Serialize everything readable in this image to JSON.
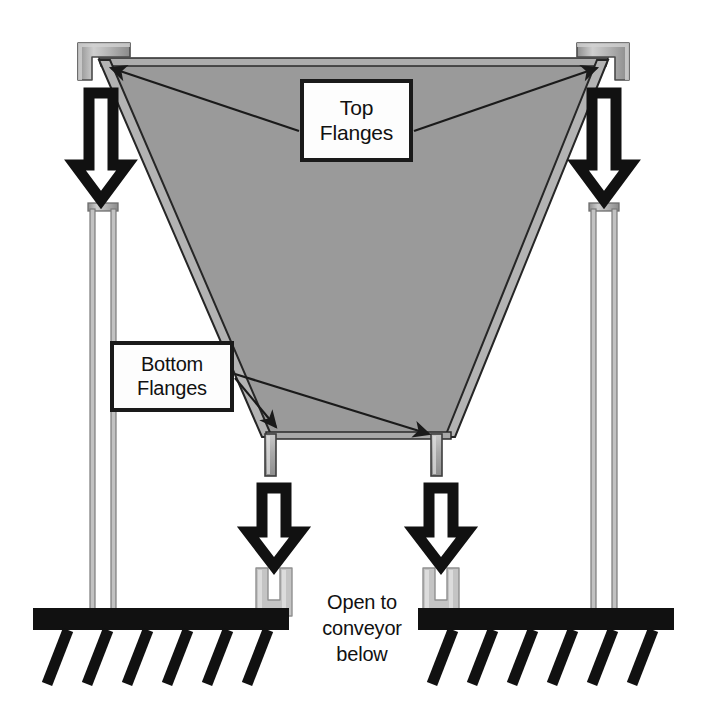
{
  "diagram": {
    "background_color": "#ffffff",
    "hopper_fill_color": "#9a9a9a",
    "outline_color": "#1a1a1a",
    "metal_color": "#b5b5b5",
    "conveyor_color": "#111111"
  },
  "labels": {
    "top_flanges": {
      "line1": "Top",
      "line2": "Flanges"
    },
    "bottom_flanges": {
      "line1": "Bottom",
      "line2": "Flanges"
    }
  },
  "caption": {
    "line1": "Open to",
    "line2": "conveyor",
    "line3": "below"
  },
  "parts": {
    "hopper": "hopper-body",
    "top_flange_left": "top-flange-left",
    "top_flange_right": "top-flange-right",
    "bottom_flange_left": "bottom-flange-left",
    "bottom_flange_right": "bottom-flange-right",
    "post_left": "guide-post-left",
    "post_right": "guide-post-right",
    "fork_left": "fork-receiver-left",
    "fork_right": "fork-receiver-right",
    "conveyor_left": "conveyor-bar-left",
    "conveyor_right": "conveyor-bar-right"
  },
  "arrows": {
    "outline_arrow_count": 4,
    "direction": "down",
    "leader_count": 4
  }
}
